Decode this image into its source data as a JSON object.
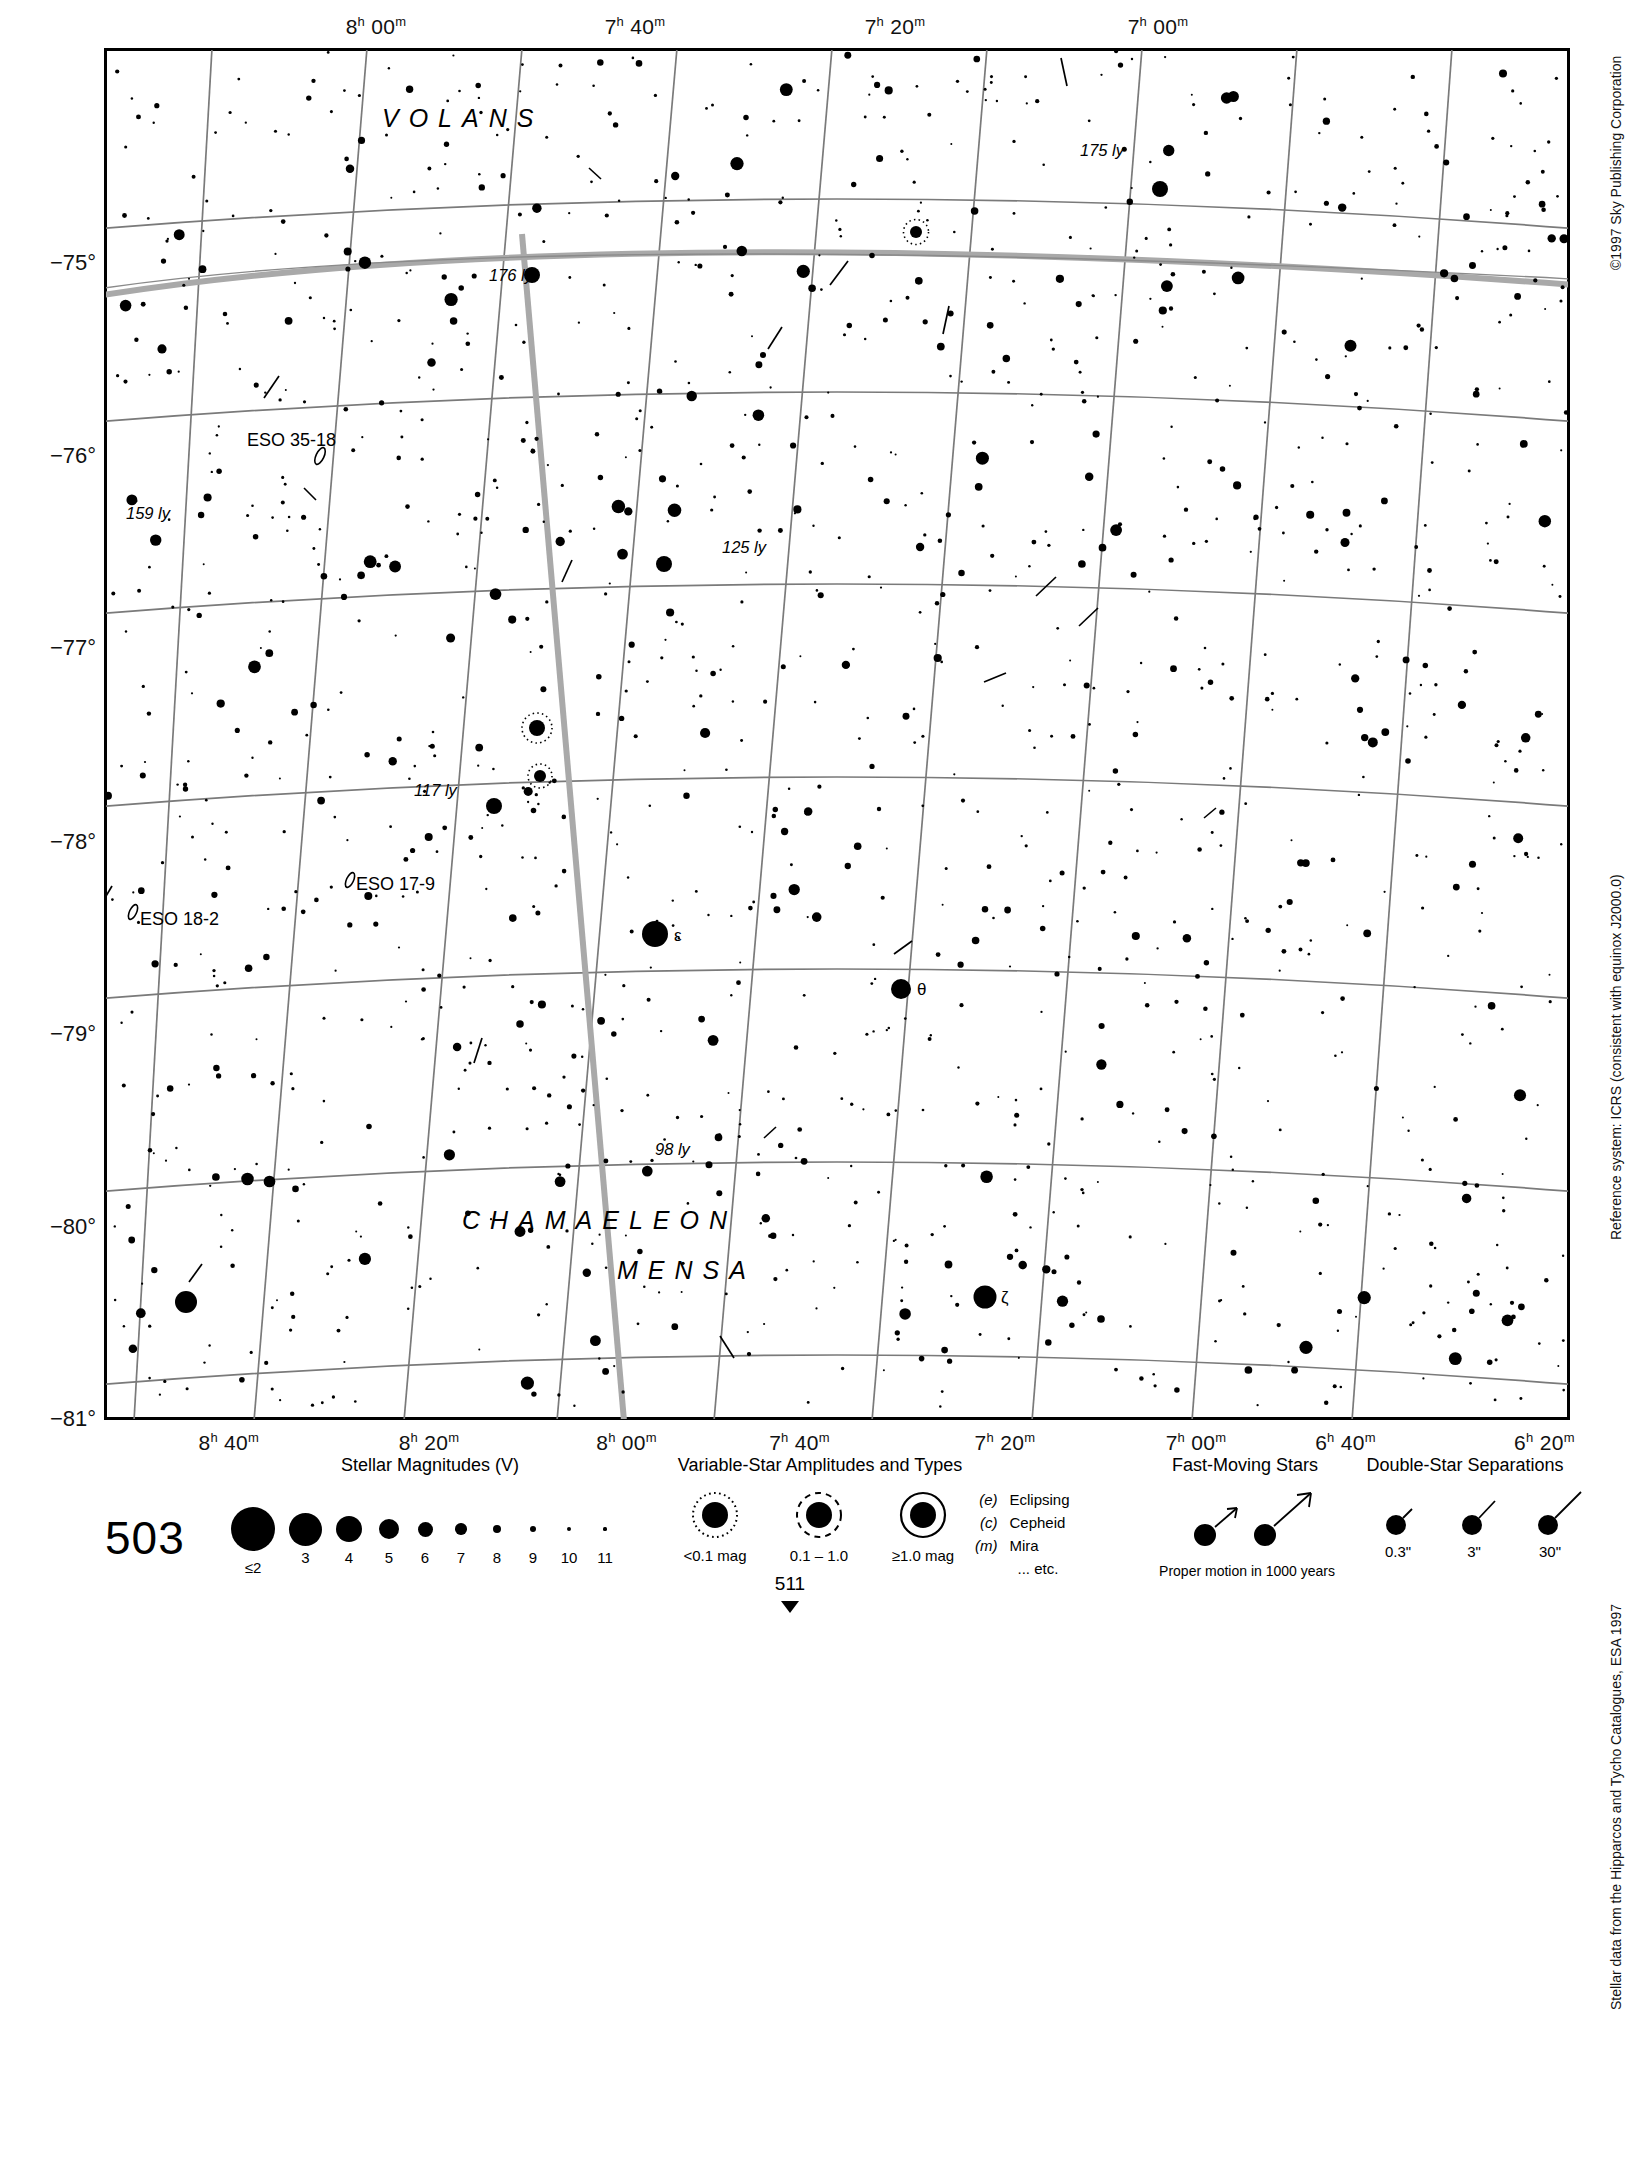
{
  "chart": {
    "number": "503",
    "next_page": "511",
    "title_hidden": true
  },
  "axes": {
    "ra_top": [
      {
        "h": "8",
        "m": "00",
        "x": 212
      },
      {
        "h": "7",
        "m": "40",
        "x": 471
      },
      {
        "h": "7",
        "m": "20",
        "x": 731
      },
      {
        "h": "7",
        "m": "00",
        "x": 994
      }
    ],
    "ra_bottom": [
      {
        "h": "8",
        "m": "40",
        "x": 96
      },
      {
        "h": "8",
        "m": "20",
        "x": 250
      },
      {
        "h": "8",
        "m": "00",
        "x": 402
      },
      {
        "h": "7",
        "m": "40",
        "x": 535
      },
      {
        "h": "7",
        "m": "20",
        "x": 693
      },
      {
        "h": "7",
        "m": "00",
        "x": 840
      },
      {
        "h": "6",
        "m": "40",
        "x": 955
      },
      {
        "h": "6",
        "m": "20",
        "x": 1108
      }
    ],
    "dec_left": [
      {
        "label": "−75°",
        "y": 216
      },
      {
        "label": "−76°",
        "y": 409
      },
      {
        "label": "−77°",
        "y": 601
      },
      {
        "label": "−78°",
        "y": 795
      },
      {
        "label": "−79°",
        "y": 987
      },
      {
        "label": "−80°",
        "y": 1180
      },
      {
        "label": "−81°",
        "y": 1372
      }
    ]
  },
  "constellations": [
    {
      "name": "VOLANS",
      "x": 278,
      "y": 56
    },
    {
      "name": "CHAMAELEON",
      "x": 463,
      "y": 1183
    },
    {
      "name": "MENSA",
      "x": 616,
      "y": 1230
    }
  ],
  "annotations": [
    {
      "type": "distance",
      "text": "175 ly",
      "x": 1080,
      "y": 143
    },
    {
      "type": "distance",
      "text": "176 ly",
      "x": 489,
      "y": 270
    },
    {
      "type": "distance",
      "text": "159 ly",
      "x": 126,
      "y": 506
    },
    {
      "type": "distance",
      "text": "125 ly",
      "x": 722,
      "y": 538
    },
    {
      "type": "distance",
      "text": "117 ly",
      "x": 414,
      "y": 782
    },
    {
      "type": "distance",
      "text": "98 ly",
      "x": 654,
      "y": 1139
    },
    {
      "type": "dso",
      "text": "ESO 35-18",
      "x": 247,
      "y": 432
    },
    {
      "type": "dso",
      "text": "ESO 17-9",
      "x": 355,
      "y": 878
    },
    {
      "type": "dso",
      "text": "ESO 18-2",
      "x": 139,
      "y": 911
    },
    {
      "type": "star",
      "text": "ε",
      "x": 654,
      "y": 932
    },
    {
      "type": "star",
      "text": "θ",
      "x": 915,
      "y": 988
    },
    {
      "type": "star",
      "text": "ζ",
      "x": 1000,
      "y": 1296
    }
  ],
  "side_notes": [
    {
      "text": "©1997 Sky Publishing Corporation",
      "top": 50
    },
    {
      "text": "Reference system: ICRS (consistent with equinox J2000.0)",
      "top": 770
    },
    {
      "text": "Stellar data from the Hipparcos and Tycho Catalogues, ESA 1997",
      "top": 1480
    }
  ],
  "legend": {
    "magnitudes": {
      "title": "Stellar Magnitudes (V)",
      "items": [
        {
          "label": "≤2",
          "size": 44
        },
        {
          "label": "3",
          "size": 33
        },
        {
          "label": "4",
          "size": 26
        },
        {
          "label": "5",
          "size": 20
        },
        {
          "label": "6",
          "size": 15
        },
        {
          "label": "7",
          "size": 11.5
        },
        {
          "label": "8",
          "size": 8.5
        },
        {
          "label": "9",
          "size": 6.5
        },
        {
          "label": "10",
          "size": 4.5
        },
        {
          "label": "11",
          "size": 3.2
        }
      ]
    },
    "variables": {
      "title": "Variable-Star Amplitudes and Types",
      "items": [
        {
          "label": "<0.1 mag",
          "ring": "dotted"
        },
        {
          "label": "0.1 – 1.0",
          "ring": "dashed"
        },
        {
          "label": "≥1.0 mag",
          "ring": "solid"
        }
      ],
      "types": [
        {
          "code": "(e)",
          "name": "Eclipsing"
        },
        {
          "code": "(c)",
          "name": "Cepheid"
        },
        {
          "code": "(m)",
          "name": "Mira"
        },
        {
          "code": "",
          "name": "... etc."
        }
      ]
    },
    "fast_moving": {
      "title": "Fast-Moving Stars",
      "caption": "Proper motion in 1000 years"
    },
    "doubles": {
      "title": "Double-Star Separations",
      "items": [
        {
          "label": "0.3\""
        },
        {
          "label": "3\""
        },
        {
          "label": "30\""
        }
      ]
    }
  },
  "chart_data": {
    "type": "scatter",
    "xlabel": "Right Ascension",
    "ylabel": "Declination",
    "xlim": [
      "8h 40m",
      "6h 20m"
    ],
    "ylim": [
      -81.4,
      -74.4
    ],
    "grid": true,
    "legend_position": "bottom",
    "named_stars": [
      {
        "name": "ε Mensae",
        "ra_approx": "7h 28m",
        "dec_approx": -78.9,
        "mag": 3.5
      },
      {
        "name": "θ Mensae",
        "ra_approx": "6h 45m",
        "dec_approx": -79.2,
        "mag": 4.3
      },
      {
        "name": "ζ Mensae",
        "ra_approx": "6h 36m",
        "dec_approx": -80.6,
        "mag": 4.0
      }
    ],
    "nearby_stars_ly": [
      175,
      176,
      159,
      125,
      117,
      98
    ],
    "deep_sky_objects": [
      "ESO 35-18",
      "ESO 17-9",
      "ESO 18-2"
    ],
    "stars": [
      [
        0.036,
        0.042,
        2.6
      ],
      [
        0.086,
        0.047,
        1.6
      ],
      [
        0.126,
        0.063,
        1.2
      ],
      [
        0.164,
        0.031,
        1.4
      ],
      [
        0.196,
        0.109,
        1.0
      ],
      [
        0.256,
        0.092,
        1.3
      ],
      [
        0.302,
        0.065,
        1.5
      ],
      [
        0.343,
        0.122,
        2.1
      ],
      [
        0.349,
        0.056,
        2.7
      ],
      [
        0.411,
        0.044,
        1.4
      ],
      [
        0.463,
        0.109,
        1.2
      ],
      [
        0.522,
        0.034,
        1.1
      ],
      [
        0.548,
        0.081,
        1.2
      ],
      [
        0.578,
        0.07,
        1.0
      ],
      [
        0.601,
        0.03,
        1.5
      ],
      [
        0.641,
        0.085,
        1.3
      ],
      [
        0.672,
        0.053,
        1.4
      ],
      [
        0.701,
        0.102,
        1.1
      ],
      [
        0.742,
        0.034,
        1.0
      ],
      [
        0.781,
        0.123,
        1.6
      ],
      [
        0.829,
        0.062,
        1.2
      ],
      [
        0.863,
        0.09,
        1.4
      ],
      [
        0.902,
        0.048,
        2.3
      ],
      [
        0.946,
        0.118,
        1.0
      ],
      [
        0.976,
        0.075,
        1.3
      ],
      [
        0.014,
        0.122,
        2.4
      ],
      [
        0.058,
        0.168,
        1.0
      ],
      [
        0.117,
        0.15,
        1.1
      ],
      [
        0.157,
        0.199,
        1.4
      ],
      [
        0.209,
        0.162,
        1.1
      ],
      [
        0.248,
        0.208,
        1.2
      ],
      [
        0.3,
        0.141,
        1.5
      ],
      [
        0.348,
        0.193,
        1.1
      ],
      [
        0.392,
        0.156,
        1.2
      ],
      [
        0.442,
        0.21,
        1.0
      ],
      [
        0.488,
        0.151,
        1.1
      ],
      [
        0.533,
        0.198,
        2.5
      ],
      [
        0.58,
        0.134,
        1.3
      ],
      [
        0.628,
        0.186,
        1.2
      ],
      [
        0.673,
        0.146,
        1.1
      ],
      [
        0.722,
        0.203,
        1.0
      ],
      [
        0.769,
        0.16,
        1.2
      ],
      [
        0.812,
        0.214,
        1.3
      ],
      [
        0.858,
        0.168,
        1.1
      ],
      [
        0.899,
        0.205,
        2.2
      ],
      [
        0.94,
        0.148,
        1.2
      ],
      [
        0.983,
        0.19,
        1.0
      ],
      [
        0.031,
        0.238,
        1.1
      ],
      [
        0.077,
        0.282,
        1.3
      ],
      [
        0.124,
        0.249,
        1.0
      ],
      [
        0.17,
        0.293,
        2.0
      ],
      [
        0.215,
        0.24,
        1.2
      ],
      [
        0.262,
        0.285,
        1.1
      ],
      [
        0.31,
        0.252,
        1.4
      ],
      [
        0.356,
        0.298,
        1.0
      ],
      [
        0.399,
        0.244,
        1.3
      ],
      [
        0.447,
        0.289,
        1.2
      ],
      [
        0.494,
        0.251,
        1.1
      ],
      [
        0.54,
        0.296,
        1.0
      ],
      [
        0.585,
        0.243,
        1.2
      ],
      [
        0.633,
        0.287,
        2.1
      ],
      [
        0.678,
        0.254,
        1.1
      ],
      [
        0.723,
        0.299,
        1.3
      ],
      [
        0.768,
        0.246,
        1.0
      ],
      [
        0.815,
        0.291,
        1.2
      ],
      [
        0.862,
        0.257,
        1.1
      ],
      [
        0.906,
        0.302,
        1.4
      ],
      [
        0.952,
        0.248,
        1.0
      ],
      [
        0.994,
        0.293,
        1.1
      ],
      [
        0.022,
        0.33,
        1.2
      ],
      [
        0.068,
        0.376,
        1.0
      ],
      [
        0.115,
        0.342,
        1.3
      ],
      [
        0.161,
        0.387,
        1.1
      ],
      [
        0.207,
        0.334,
        2.3
      ],
      [
        0.253,
        0.379,
        1.0
      ],
      [
        0.3,
        0.345,
        1.2
      ],
      [
        0.345,
        0.39,
        1.1
      ],
      [
        0.392,
        0.337,
        1.3
      ],
      [
        0.438,
        0.382,
        1.0
      ],
      [
        0.484,
        0.348,
        1.2
      ],
      [
        0.53,
        0.393,
        1.1
      ],
      [
        0.576,
        0.34,
        2.6
      ],
      [
        0.622,
        0.385,
        1.0
      ],
      [
        0.668,
        0.351,
        1.2
      ],
      [
        0.713,
        0.396,
        1.1
      ],
      [
        0.759,
        0.343,
        1.3
      ],
      [
        0.805,
        0.388,
        1.0
      ],
      [
        0.851,
        0.354,
        1.2
      ],
      [
        0.897,
        0.399,
        1.1
      ],
      [
        0.943,
        0.346,
        1.4
      ],
      [
        0.988,
        0.391,
        1.0
      ],
      [
        0.015,
        0.425,
        1.2
      ],
      [
        0.06,
        0.47,
        1.1
      ],
      [
        0.107,
        0.437,
        1.0
      ],
      [
        0.153,
        0.482,
        1.3
      ],
      [
        0.199,
        0.428,
        1.1
      ],
      [
        0.245,
        0.473,
        1.2
      ],
      [
        0.291,
        0.44,
        1.0
      ],
      [
        0.337,
        0.485,
        2.2
      ],
      [
        0.383,
        0.431,
        1.1
      ],
      [
        0.429,
        0.476,
        1.2
      ],
      [
        0.475,
        0.443,
        1.0
      ],
      [
        0.521,
        0.488,
        1.3
      ],
      [
        0.567,
        0.434,
        1.1
      ],
      [
        0.613,
        0.479,
        1.2
      ],
      [
        0.659,
        0.446,
        1.0
      ],
      [
        0.705,
        0.491,
        1.1
      ],
      [
        0.751,
        0.437,
        1.3
      ],
      [
        0.797,
        0.482,
        1.0
      ],
      [
        0.843,
        0.449,
        1.2
      ],
      [
        0.889,
        0.494,
        1.1
      ],
      [
        0.935,
        0.44,
        2.4
      ],
      [
        0.981,
        0.485,
        1.0
      ],
      [
        0.028,
        0.52,
        1.1
      ],
      [
        0.074,
        0.565,
        1.2
      ],
      [
        0.12,
        0.532,
        1.0
      ],
      [
        0.166,
        0.577,
        1.1
      ],
      [
        0.212,
        0.523,
        1.3
      ],
      [
        0.258,
        0.568,
        1.0
      ],
      [
        0.304,
        0.535,
        1.2
      ],
      [
        0.35,
        0.58,
        1.1
      ],
      [
        0.396,
        0.526,
        1.0
      ],
      [
        0.442,
        0.571,
        1.2
      ],
      [
        0.488,
        0.538,
        2.1
      ],
      [
        0.534,
        0.583,
        1.0
      ],
      [
        0.58,
        0.529,
        1.1
      ],
      [
        0.626,
        0.574,
        1.2
      ],
      [
        0.672,
        0.541,
        1.0
      ],
      [
        0.718,
        0.586,
        1.1
      ],
      [
        0.764,
        0.532,
        1.3
      ],
      [
        0.81,
        0.577,
        1.0
      ],
      [
        0.856,
        0.544,
        1.2
      ],
      [
        0.902,
        0.589,
        1.1
      ],
      [
        0.948,
        0.535,
        1.0
      ],
      [
        0.994,
        0.58,
        1.2
      ],
      [
        0.02,
        0.615,
        1.1
      ],
      [
        0.066,
        0.66,
        1.0
      ],
      [
        0.112,
        0.627,
        1.2
      ],
      [
        0.158,
        0.672,
        1.1
      ],
      [
        0.204,
        0.618,
        1.3
      ],
      [
        0.25,
        0.663,
        1.0
      ],
      [
        0.296,
        0.63,
        2.5
      ],
      [
        0.342,
        0.675,
        1.1
      ],
      [
        0.388,
        0.621,
        1.2
      ],
      [
        0.434,
        0.666,
        1.0
      ],
      [
        0.48,
        0.633,
        1.1
      ],
      [
        0.526,
        0.678,
        1.2
      ],
      [
        0.572,
        0.624,
        1.0
      ],
      [
        0.618,
        0.669,
        1.1
      ],
      [
        0.664,
        0.636,
        1.3
      ],
      [
        0.71,
        0.681,
        1.0
      ],
      [
        0.756,
        0.627,
        1.2
      ],
      [
        0.802,
        0.672,
        1.1
      ],
      [
        0.848,
        0.639,
        1.0
      ],
      [
        0.894,
        0.684,
        1.2
      ],
      [
        0.94,
        0.63,
        1.1
      ],
      [
        0.986,
        0.675,
        1.0
      ],
      [
        0.012,
        0.71,
        1.2
      ],
      [
        0.058,
        0.755,
        1.1
      ],
      [
        0.104,
        0.722,
        1.0
      ],
      [
        0.15,
        0.767,
        1.3
      ],
      [
        0.196,
        0.713,
        1.1
      ],
      [
        0.242,
        0.758,
        1.2
      ],
      [
        0.288,
        0.725,
        1.0
      ],
      [
        0.334,
        0.77,
        1.1
      ],
      [
        0.38,
        0.716,
        1.2
      ],
      [
        0.426,
        0.761,
        1.0
      ],
      [
        0.472,
        0.728,
        2.3
      ],
      [
        0.518,
        0.773,
        1.1
      ],
      [
        0.564,
        0.719,
        1.2
      ],
      [
        0.61,
        0.764,
        1.0
      ],
      [
        0.656,
        0.731,
        1.1
      ],
      [
        0.702,
        0.776,
        1.2
      ],
      [
        0.748,
        0.722,
        1.0
      ],
      [
        0.794,
        0.767,
        1.1
      ],
      [
        0.84,
        0.734,
        1.3
      ],
      [
        0.886,
        0.779,
        1.0
      ],
      [
        0.932,
        0.725,
        1.2
      ],
      [
        0.978,
        0.77,
        1.1
      ],
      [
        0.034,
        0.805,
        1.0
      ],
      [
        0.08,
        0.85,
        1.2
      ],
      [
        0.126,
        0.817,
        1.1
      ],
      [
        0.172,
        0.862,
        1.0
      ],
      [
        0.218,
        0.808,
        1.3
      ],
      [
        0.264,
        0.853,
        1.1
      ],
      [
        0.31,
        0.82,
        1.2
      ],
      [
        0.356,
        0.865,
        1.0
      ],
      [
        0.402,
        0.811,
        1.1
      ],
      [
        0.448,
        0.856,
        1.2
      ],
      [
        0.494,
        0.823,
        1.0
      ],
      [
        0.54,
        0.868,
        1.1
      ],
      [
        0.586,
        0.814,
        2.0
      ],
      [
        0.632,
        0.859,
        1.2
      ],
      [
        0.678,
        0.826,
        1.0
      ],
      [
        0.724,
        0.871,
        1.1
      ],
      [
        0.77,
        0.817,
        1.2
      ],
      [
        0.816,
        0.862,
        1.0
      ],
      [
        0.862,
        0.829,
        1.1
      ],
      [
        0.908,
        0.874,
        1.3
      ],
      [
        0.954,
        0.82,
        1.0
      ],
      [
        0.026,
        0.9,
        1.1
      ],
      [
        0.072,
        0.945,
        1.2
      ],
      [
        0.118,
        0.912,
        1.0
      ],
      [
        0.164,
        0.957,
        1.1
      ],
      [
        0.21,
        0.903,
        1.3
      ],
      [
        0.256,
        0.948,
        1.0
      ],
      [
        0.302,
        0.915,
        1.2
      ],
      [
        0.348,
        0.96,
        1.1
      ],
      [
        0.394,
        0.906,
        1.0
      ],
      [
        0.44,
        0.951,
        1.2
      ],
      [
        0.486,
        0.918,
        1.1
      ],
      [
        0.532,
        0.963,
        1.0
      ],
      [
        0.578,
        0.909,
        1.2
      ],
      [
        0.624,
        0.954,
        1.1
      ],
      [
        0.67,
        0.921,
        1.0
      ],
      [
        0.716,
        0.966,
        1.3
      ],
      [
        0.762,
        0.912,
        1.1
      ],
      [
        0.808,
        0.957,
        1.2
      ],
      [
        0.854,
        0.924,
        1.0
      ],
      [
        0.9,
        0.969,
        1.1
      ],
      [
        0.946,
        0.915,
        1.2
      ],
      [
        0.992,
        0.96,
        1.0
      ]
    ]
  }
}
